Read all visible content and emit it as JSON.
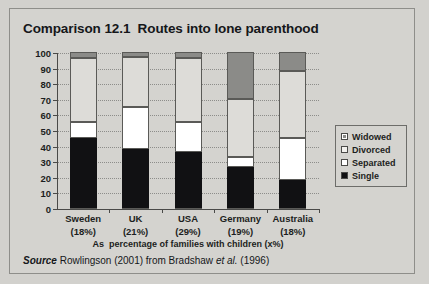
{
  "figure": {
    "title": "Comparison 12.1  Routes into lone parenthood",
    "axis_caption": "As  percentage of families with children (x%)",
    "source_prefix": "Source",
    "source_text": " Rowlingson (2001) from Bradshaw ",
    "source_etal": "et al.",
    "source_suffix": " (1996)"
  },
  "chart_data": {
    "type": "bar",
    "subtype": "stacked-100",
    "title": "Comparison 12.1  Routes into lone parenthood",
    "xlabel": "As  percentage of families with children (x%)",
    "ylabel": "",
    "ylim": [
      0,
      100
    ],
    "ytick_step": 10,
    "yticks": [
      0,
      10,
      20,
      30,
      40,
      50,
      60,
      70,
      80,
      90,
      100
    ],
    "ytick_labels": [
      "0",
      "10",
      "20",
      "30",
      "40",
      "50",
      "60",
      "70",
      "80",
      "90",
      "100"
    ],
    "grid": true,
    "legend_position": "right",
    "categories": [
      "Sweden",
      "UK",
      "USA",
      "Germany",
      "Australia"
    ],
    "category_sublabels": [
      "(18%)",
      "(21%)",
      "(29%)",
      "(19%)",
      "(18%)"
    ],
    "series": [
      {
        "name": "Single",
        "color": "#111113",
        "values": [
          45,
          38,
          36,
          26,
          18
        ]
      },
      {
        "name": "Separated",
        "color": "#ffffff",
        "values": [
          10,
          27,
          19,
          7,
          27
        ]
      },
      {
        "name": "Divorced",
        "color": "#dddcd8",
        "values": [
          41,
          32,
          41,
          37,
          43
        ]
      },
      {
        "name": "Widowed",
        "color": "#8b8b88",
        "values": [
          4,
          3,
          4,
          30,
          12
        ]
      }
    ],
    "legend_order": [
      "Widowed",
      "Divorced",
      "Separated",
      "Single"
    ]
  },
  "legend": {
    "items": [
      {
        "label": "Widowed",
        "swatch": "widowed"
      },
      {
        "label": "Divorced",
        "swatch": "divorced"
      },
      {
        "label": "Separated",
        "swatch": "separated"
      },
      {
        "label": "Single",
        "swatch": "single"
      }
    ]
  },
  "colors": {
    "page_background": "#d2d1cd",
    "figure_background": "#d4d3cf",
    "border": "#8e8e8a",
    "axis": "#4a4a48",
    "grid": "#8d8d8a",
    "text": "#15171a"
  }
}
